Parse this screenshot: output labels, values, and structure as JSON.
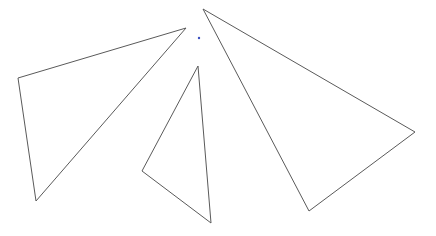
{
  "canvas": {
    "width": 436,
    "height": 236,
    "background": "#ffffff"
  },
  "stroke_color": "#5a5a5a",
  "stroke_width": 1,
  "shapes": [
    {
      "name": "triangle-left",
      "points": [
        [
          18,
          78
        ],
        [
          186,
          28
        ],
        [
          36,
          201
        ]
      ]
    },
    {
      "name": "triangle-middle",
      "points": [
        [
          198,
          66
        ],
        [
          211,
          223
        ],
        [
          142,
          171
        ]
      ]
    },
    {
      "name": "triangle-right",
      "points": [
        [
          203,
          9
        ],
        [
          415,
          132
        ],
        [
          309,
          211
        ]
      ]
    }
  ],
  "marker": {
    "name": "blue-dot",
    "x": 199,
    "y": 38,
    "color": "#3a4fc0",
    "radius": 1.2
  }
}
